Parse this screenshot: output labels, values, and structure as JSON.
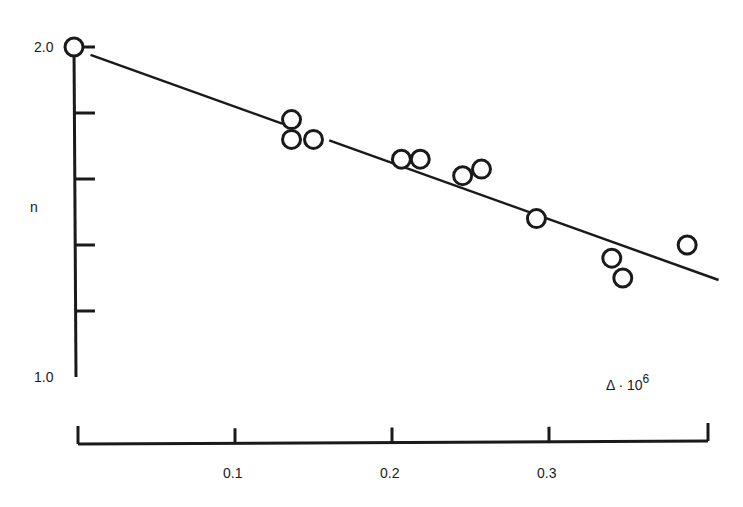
{
  "chart_data": {
    "type": "scatter",
    "title": "",
    "xlabel": "Δ · 10⁶",
    "xlabel_parts": {
      "base": "Δ · 10",
      "sup": "6"
    },
    "ylabel": "n",
    "xlim": [
      0,
      0.4
    ],
    "ylim": [
      1.0,
      2.0
    ],
    "x_ticks": [
      0,
      0.1,
      0.2,
      0.3,
      0.4
    ],
    "x_tick_labels": [
      "",
      "0.1",
      "0.2",
      "0.3",
      ""
    ],
    "y_ticks": [
      1.0,
      1.2,
      1.4,
      1.6,
      1.8,
      2.0
    ],
    "y_tick_labels": [
      "1.0",
      "",
      "",
      "",
      "",
      "2.0"
    ],
    "grid": false,
    "legend": null,
    "series": [
      {
        "name": "measurements",
        "marker": "open-circle",
        "points": [
          {
            "x": 0.0,
            "y": 2.0
          },
          {
            "x": 0.136,
            "y": 1.78
          },
          {
            "x": 0.136,
            "y": 1.72
          },
          {
            "x": 0.15,
            "y": 1.72
          },
          {
            "x": 0.206,
            "y": 1.66
          },
          {
            "x": 0.218,
            "y": 1.66
          },
          {
            "x": 0.245,
            "y": 1.61
          },
          {
            "x": 0.257,
            "y": 1.63
          },
          {
            "x": 0.292,
            "y": 1.48
          },
          {
            "x": 0.34,
            "y": 1.36
          },
          {
            "x": 0.347,
            "y": 1.3
          },
          {
            "x": 0.388,
            "y": 1.4
          }
        ]
      },
      {
        "name": "linear fit",
        "type": "line",
        "points": [
          {
            "x": 0.008,
            "y": 1.976
          },
          {
            "x": 0.408,
            "y": 1.294
          }
        ]
      }
    ]
  }
}
